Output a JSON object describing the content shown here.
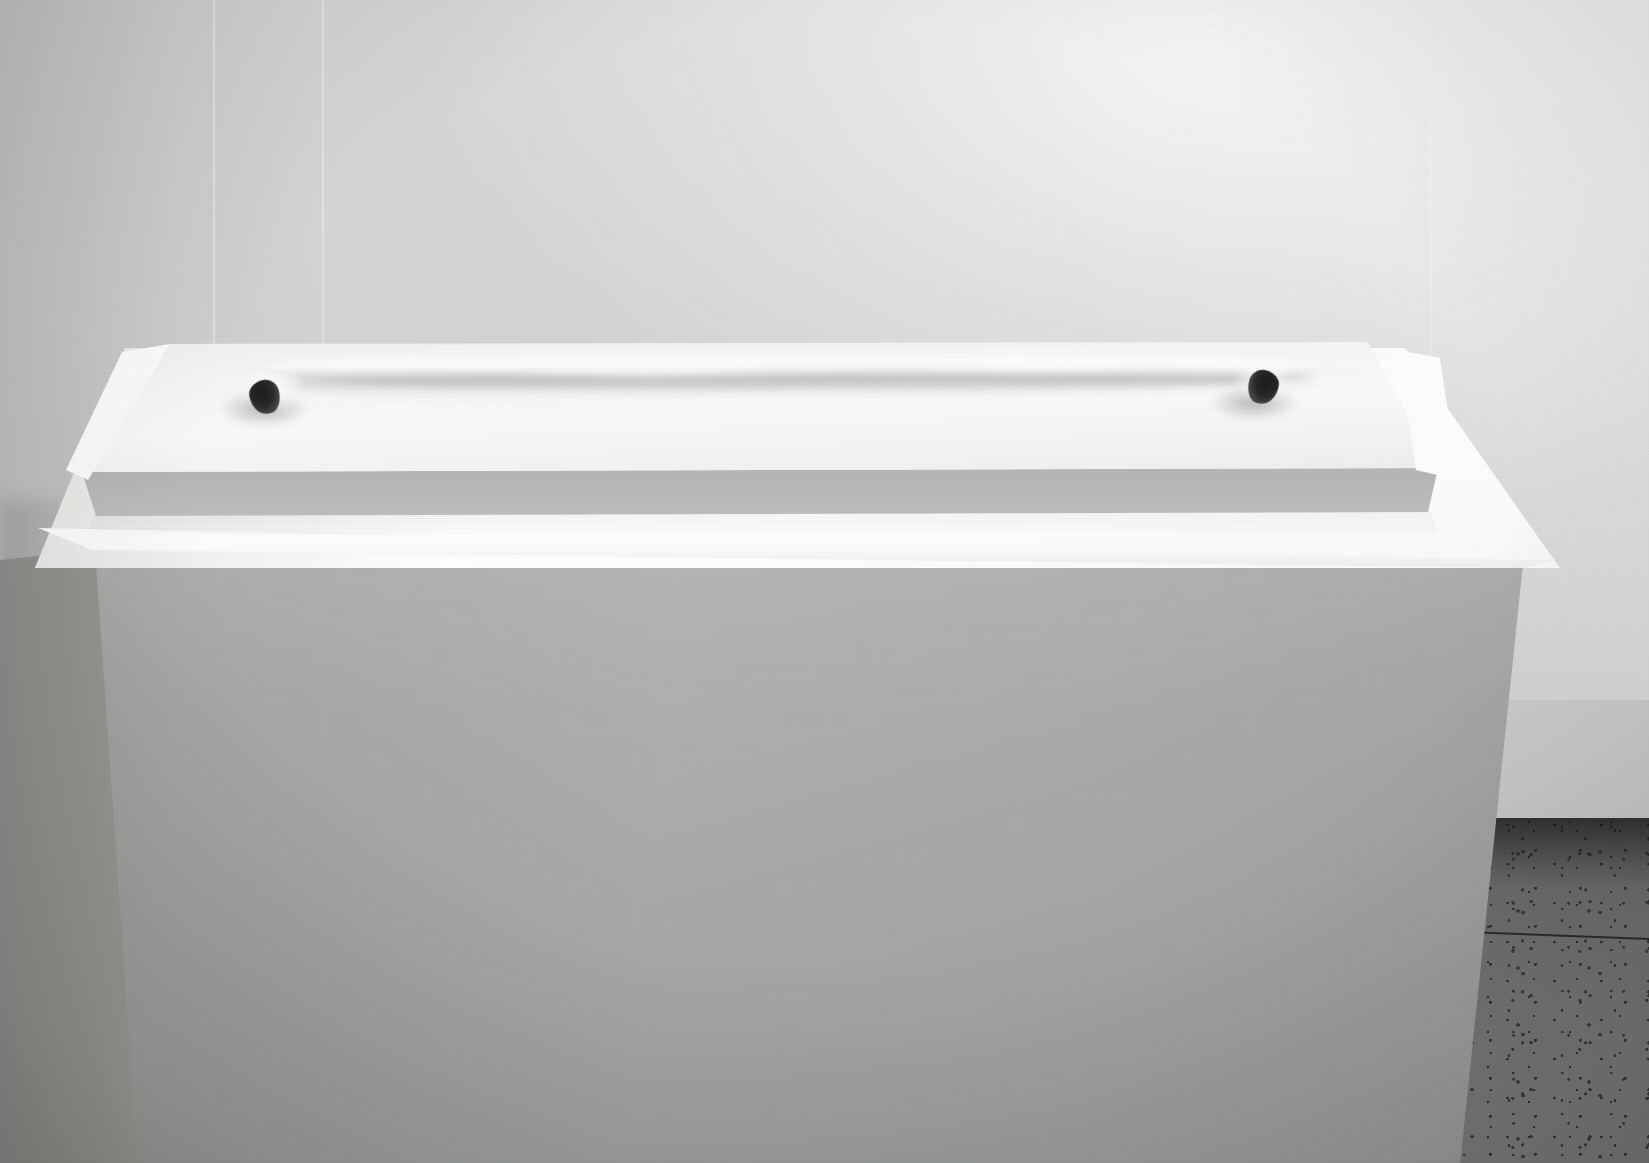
{
  "scene": {
    "title": "Gallery installation: white foam slab on pedestal",
    "medium": "photograph",
    "orientation": "landscape",
    "width_px": 1649,
    "height_px": 1163,
    "color_mode": "desaturated grayscale"
  },
  "palette": {
    "wall_light": "#d7d9d6",
    "wall_mid": "#c6c8c5",
    "wall_shadow": "#b3b6b2",
    "pedestal_top": "#ffffff",
    "pedestal_front": "#adb0ac",
    "pedestal_side": "#91948f",
    "slab_top": "#f8f9f7",
    "slab_front_edge": "#bdc0bc",
    "hole_dark": "#1a1c1a",
    "floor_terrazzo": "#6f716e",
    "floor_speckle": "#2c2e2c",
    "grout_line": "#121412"
  },
  "elements": {
    "wall": {
      "label": "Gallery back wall",
      "description": "Smooth matte light-gray wall, brightest toward the upper right, with faint vertical panel seams"
    },
    "wall_seams": {
      "label": "Wall panel seams",
      "count": 3,
      "description": "Faint near-white vertical joint lines in the wall surface"
    },
    "floor": {
      "label": "Terrazzo floor",
      "description": "Dark gray speckled terrazzo tile floor with thin grout lines, visible at lower left and lower right"
    },
    "pedestal": {
      "label": "Gallery pedestal",
      "description": "Tall rectangular white plinth shown in slight perspective; bright top plane, mid-gray front face, darker left side face"
    },
    "slab": {
      "label": "Foam slab",
      "description": "Low rectangular white foam block with softly chamfered corners resting on the pedestal top"
    },
    "ridge": {
      "label": "Raised ridge",
      "description": "A soft undulating raised seam running horizontally across the slab surface, connecting the two openings"
    },
    "hole_left": {
      "label": "Left opening",
      "description": "Small dark teardrop-shaped aperture in the slab surface, left end of the ridge"
    },
    "hole_right": {
      "label": "Right opening",
      "description": "Small dark teardrop-shaped aperture in the slab surface, right end of the ridge"
    },
    "shadow": {
      "label": "Contact shadow",
      "description": "Soft gray shadow where the slab meets the pedestal top"
    }
  },
  "composition": {
    "horizon_note": "Wall meets floor at roughly 72% of image height",
    "light_source": "diffuse, from upper right",
    "focal_subject": "foam slab with two dark openings"
  }
}
